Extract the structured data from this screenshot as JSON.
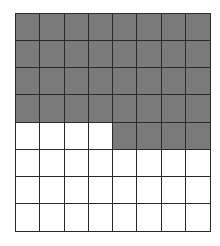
{
  "figure": {
    "type": "shaded-grid",
    "rows": 8,
    "cols": 8,
    "total_cells": 64,
    "shaded_count": 36,
    "shaded_color": "#7a7a7a",
    "unshaded_color": "#ffffff",
    "line_color": "#2a2a2a",
    "shaded_map": [
      [
        1,
        1,
        1,
        1,
        1,
        1,
        1,
        1
      ],
      [
        1,
        1,
        1,
        1,
        1,
        1,
        1,
        1
      ],
      [
        1,
        1,
        1,
        1,
        1,
        1,
        1,
        1
      ],
      [
        1,
        1,
        1,
        1,
        1,
        1,
        1,
        1
      ],
      [
        0,
        0,
        0,
        0,
        1,
        1,
        1,
        1
      ],
      [
        0,
        0,
        0,
        0,
        0,
        0,
        0,
        0
      ],
      [
        0,
        0,
        0,
        0,
        0,
        0,
        0,
        0
      ],
      [
        0,
        0,
        0,
        0,
        0,
        0,
        0,
        0
      ]
    ]
  }
}
